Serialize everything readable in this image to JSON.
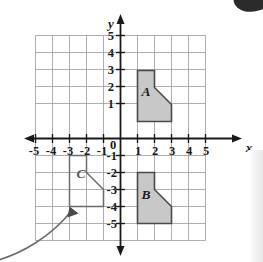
{
  "figure": {
    "type": "coordinate-plane",
    "axis_labels": {
      "x": "x",
      "y": "y",
      "origin": "0"
    },
    "x_ticks": [
      "-5",
      "-4",
      "-3",
      "-2",
      "-1",
      "1",
      "2",
      "3",
      "4",
      "5"
    ],
    "y_ticks_positive": [
      "5",
      "4",
      "3",
      "2",
      "1"
    ],
    "y_ticks_negative": [
      "-1",
      "-2",
      "-3",
      "-4",
      "-5"
    ],
    "axis_range": {
      "xmin": -5,
      "xmax": 5,
      "ymin": -5,
      "ymax": 5
    },
    "grid": true,
    "colors": {
      "grid_line": "#9a9a9a",
      "axis_line": "#1a1a1a",
      "shape_fill": "#c8c8c8",
      "shape_stroke": "#4a4a4a",
      "outline_stroke": "#6b6b6b",
      "pointer": "#6b6b6b",
      "text": "#1a1a1a"
    },
    "shapes": [
      {
        "label": "A",
        "filled": true,
        "label_point": [
          1.35,
          2.45
        ],
        "vertices": [
          [
            1,
            1
          ],
          [
            1,
            4
          ],
          [
            2,
            4
          ],
          [
            2,
            3
          ],
          [
            3,
            2
          ],
          [
            3,
            1
          ]
        ]
      },
      {
        "label": "B",
        "filled": true,
        "label_point": [
          1.35,
          -3.55
        ],
        "vertices": [
          [
            1,
            -5
          ],
          [
            1,
            -2
          ],
          [
            2,
            -2
          ],
          [
            2,
            -3
          ],
          [
            3,
            -4
          ],
          [
            3,
            -5
          ]
        ]
      },
      {
        "label": "C",
        "filled": false,
        "label_point": [
          -2.65,
          -2.45
        ],
        "vertices": [
          [
            -3,
            -4
          ],
          [
            -3,
            -1
          ],
          [
            -2,
            -1
          ],
          [
            -2,
            -2
          ],
          [
            -1,
            -3
          ],
          [
            -1,
            -4
          ]
        ]
      }
    ],
    "pointer": {
      "name": "leader-arrow",
      "target_point": [
        -3,
        -4
      ],
      "path": "M -6 258 C 30 250, 62 232, 80 208"
    }
  }
}
